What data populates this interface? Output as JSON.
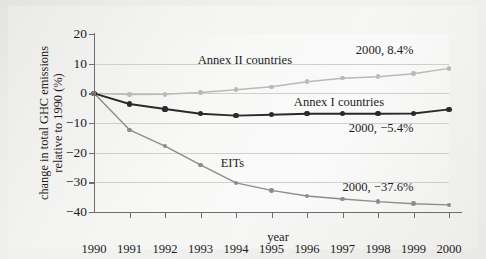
{
  "chart_data": {
    "type": "line",
    "title": "",
    "xlabel": "year",
    "ylabel": "change in total GHC emissions relative to 1990 (%)",
    "x": [
      1990,
      1991,
      1992,
      1993,
      1994,
      1995,
      1996,
      1997,
      1998,
      1999,
      2000
    ],
    "xtick_labels": [
      "1990",
      "1991",
      "1992",
      "1993",
      "1994",
      "1995",
      "1996",
      "1997",
      "1998",
      "1999",
      "2000"
    ],
    "ytick_labels": [
      "20",
      "10",
      "0",
      "-10",
      "-20",
      "-30",
      "-40"
    ],
    "ytick_values": [
      20,
      10,
      0,
      -10,
      -20,
      -30,
      -40
    ],
    "ylim": [
      -40,
      20
    ],
    "xlim": [
      1990,
      2000
    ],
    "grid": true,
    "legend_position": "inline-labels",
    "series": [
      {
        "name": "Annex II countries",
        "color": "#b9b9b9",
        "label_x": 1994.25,
        "label_y": 11.3,
        "end_annotation": "2000, 8.4%",
        "values": [
          0.0,
          -0.4,
          -0.3,
          0.3,
          1.2,
          2.2,
          3.9,
          5.1,
          5.6,
          6.6,
          8.4
        ]
      },
      {
        "name": "Annex I countries",
        "color": "#2a2a2a",
        "label_x": 1996.9,
        "label_y": -3.0,
        "end_annotation": "2000, −5.4%",
        "values": [
          0.0,
          -3.6,
          -5.3,
          -6.9,
          -7.5,
          -7.2,
          -6.9,
          -6.9,
          -6.9,
          -6.8,
          -5.4
        ]
      },
      {
        "name": "EITs",
        "color": "#8c8c8c",
        "label_x": 1993.9,
        "label_y": -23.6,
        "end_annotation": "2000, −37.6%",
        "values": [
          0.0,
          -12.3,
          -17.8,
          -24.1,
          -30.2,
          -32.7,
          -34.6,
          -35.6,
          -36.5,
          -37.2,
          -37.6
        ]
      }
    ],
    "annotations": [
      {
        "text": "2000, 8.4%",
        "x": 1999.0,
        "y": 14.6
      },
      {
        "text": "2000, −5.4%",
        "x": 1999.0,
        "y": -11.6
      },
      {
        "text": "2000, −37.6%",
        "x": 1999.0,
        "y": -31.6
      }
    ]
  }
}
